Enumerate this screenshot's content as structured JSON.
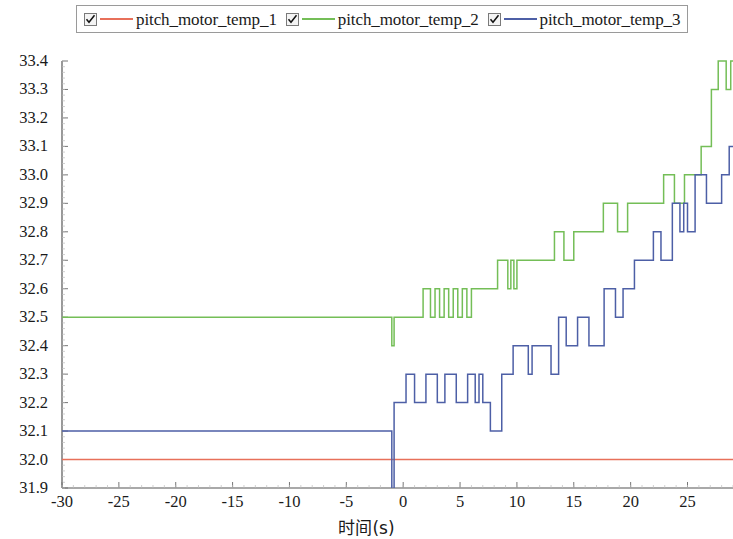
{
  "legend": {
    "position": "top",
    "entries": [
      {
        "label": "pitch_motor_temp_1",
        "color": "#E8705A",
        "checked": true,
        "checkbox_icon": "checkbox-checked-icon"
      },
      {
        "label": "pitch_motor_temp_2",
        "color": "#74BE57",
        "checked": true,
        "checkbox_icon": "checkbox-checked-icon"
      },
      {
        "label": "pitch_motor_temp_3",
        "color": "#4D5FA6",
        "checked": true,
        "checkbox_icon": "checkbox-checked-icon"
      }
    ]
  },
  "chart_data": {
    "type": "line",
    "title": "",
    "subtitle": "",
    "xlabel": "时间(s)",
    "ylabel": "",
    "xlim": [
      -30,
      29
    ],
    "ylim": [
      31.9,
      33.4
    ],
    "grid": false,
    "x_ticks": [
      -30,
      -25,
      -20,
      -15,
      -10,
      -5,
      0,
      5,
      10,
      15,
      20,
      25
    ],
    "x_tick_labels": [
      "-30",
      "-25",
      "-20",
      "-15",
      "-10",
      "-5",
      "0",
      "5",
      "10",
      "15",
      "20",
      "25"
    ],
    "x_minor_tick_step": 1,
    "y_ticks": [
      31.9,
      32.0,
      32.1,
      32.2,
      32.3,
      32.4,
      32.5,
      32.6,
      32.7,
      32.8,
      32.9,
      33.0,
      33.1,
      33.2,
      33.3,
      33.4
    ],
    "y_tick_labels": [
      "31.9",
      "32.0",
      "32.1",
      "32.2",
      "32.3",
      "32.4",
      "32.5",
      "32.6",
      "32.7",
      "32.8",
      "32.9",
      "33.0",
      "33.1",
      "33.2",
      "33.3",
      "33.4"
    ],
    "y_minor_tick_step": 0.02,
    "legend_position": "top-outside",
    "series": [
      {
        "name": "pitch_motor_temp_1",
        "color": "#E8705A",
        "style": "flat-line",
        "note": "Essentially constant at 32.0 across the whole window",
        "x": [
          -30,
          -20,
          -10,
          -1,
          0,
          10,
          20,
          29
        ],
        "values": [
          32.0,
          32.0,
          32.0,
          32.0,
          32.0,
          32.0,
          32.0,
          32.0
        ]
      },
      {
        "name": "pitch_motor_temp_2",
        "color": "#74BE57",
        "style": "quantized-step",
        "note": "Flat at 32.5 until t=-1 where a single sample dips to 32.4, then dithered staircase rising to 33.4",
        "x": [
          -30,
          -2,
          -1.2,
          -1.0,
          -0.8,
          0,
          1.5,
          2,
          2.4,
          2.8,
          3.2,
          3.6,
          4,
          4.4,
          4.8,
          5.2,
          5.6,
          6,
          7,
          8,
          8.6,
          9.2,
          10,
          12,
          13,
          13.6,
          14.4,
          15,
          17,
          18.5,
          19.2,
          20,
          22,
          23.5,
          24.2,
          25,
          26.5,
          27.4,
          28,
          28.4,
          28.8,
          29
        ],
        "values": [
          32.5,
          32.5,
          32.5,
          32.4,
          32.5,
          32.5,
          32.5,
          32.6,
          32.5,
          32.6,
          32.5,
          32.6,
          32.5,
          32.6,
          32.5,
          32.6,
          32.5,
          32.6,
          32.6,
          32.6,
          32.7,
          32.6,
          32.7,
          32.7,
          32.7,
          32.8,
          32.7,
          32.8,
          32.8,
          32.9,
          32.8,
          32.9,
          32.9,
          33.0,
          32.9,
          33.0,
          33.1,
          33.3,
          33.4,
          33.3,
          33.4,
          33.4
        ]
      },
      {
        "name": "pitch_motor_temp_3",
        "color": "#4D5FA6",
        "style": "quantized-step",
        "note": "Flat at 32.1 until t=-1 where a single sample dips to ~31.88, then heavy dithering rising from 32.2 to 33.1",
        "x": [
          -30,
          -1.2,
          -1.0,
          -0.8,
          0,
          0.5,
          1,
          2,
          3,
          4,
          5,
          6,
          7,
          8,
          9,
          10,
          11,
          12,
          13,
          14,
          15,
          16,
          17,
          18,
          19,
          20,
          21,
          22,
          23,
          24,
          25,
          26,
          27,
          28,
          29
        ],
        "values": [
          32.1,
          32.1,
          31.88,
          32.2,
          32.2,
          32.3,
          32.2,
          32.3,
          32.2,
          32.3,
          32.2,
          32.3,
          32.2,
          32.1,
          32.3,
          32.4,
          32.3,
          32.4,
          32.3,
          32.5,
          32.4,
          32.5,
          32.4,
          32.6,
          32.5,
          32.6,
          32.7,
          32.8,
          32.7,
          32.9,
          32.8,
          33.0,
          32.9,
          33.0,
          33.1
        ]
      }
    ]
  }
}
